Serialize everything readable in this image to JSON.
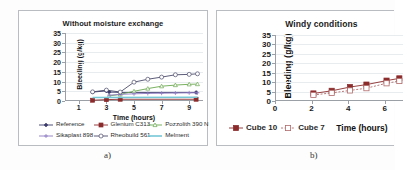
{
  "figure": {
    "caption_a": "a)",
    "caption_b": "b)"
  },
  "chart_data": [
    {
      "panel": "a",
      "type": "line",
      "title": "Without moisture exchange",
      "xlabel": "Time (hours)",
      "ylabel": "Bleeding (g/kg)",
      "xlim": [
        0,
        10
      ],
      "ylim": [
        0,
        35
      ],
      "xticks": [
        1,
        3,
        5,
        7,
        9
      ],
      "yticks": [
        0,
        5,
        10,
        15,
        20,
        25,
        30,
        35
      ],
      "grid": true,
      "legend_position": "bottom",
      "series": [
        {
          "name": "Reference",
          "color": "#3b3b6b",
          "marker": "diamond",
          "x": [
            2,
            3,
            3.2,
            4,
            9.5
          ],
          "values": [
            4.6,
            5.2,
            4.6,
            4.4,
            4.4
          ]
        },
        {
          "name": "Glenium C313",
          "color": "#8c2b2b",
          "marker": "square",
          "x": [
            2,
            3,
            4,
            9.5
          ],
          "values": [
            0.4,
            0.7,
            0.9,
            0.9
          ]
        },
        {
          "name": "Pozzolith 390 N",
          "color": "#6aa84f",
          "marker": "triangle",
          "x": [
            3.2,
            4,
            5,
            6,
            7,
            8,
            9,
            9.6
          ],
          "values": [
            2.6,
            3.4,
            5.0,
            6.4,
            7.6,
            8.2,
            8.6,
            8.7
          ]
        },
        {
          "name": "Sikaplast 898",
          "color": "#8e7cc3",
          "marker": "plus",
          "x": [
            3.2,
            4,
            5,
            6,
            7,
            8,
            9,
            9.6
          ],
          "values": [
            3.0,
            3.4,
            3.7,
            3.9,
            4.0,
            4.1,
            4.2,
            4.2
          ]
        },
        {
          "name": "Rheobuild 561",
          "color": "#4b4b6b",
          "marker": "circle",
          "x": [
            2,
            3,
            4,
            5,
            6,
            7,
            8,
            9,
            9.6
          ],
          "values": [
            4.7,
            5.6,
            4.6,
            9.7,
            11.2,
            12.3,
            13.5,
            13.7,
            14.0
          ]
        },
        {
          "name": "Melment",
          "color": "#76c7d6",
          "marker": "none",
          "x": [
            2,
            9.6
          ],
          "values": [
            1.8,
            1.9
          ]
        }
      ]
    },
    {
      "panel": "b",
      "type": "line",
      "title": "Windy conditions",
      "xlabel": "Time (hours)",
      "ylabel": "Bleeding (g/kg)",
      "xlim": [
        0,
        7
      ],
      "ylim": [
        0,
        35
      ],
      "xticks": [
        0,
        2,
        4,
        6
      ],
      "yticks": [
        0,
        5,
        10,
        15,
        20,
        25,
        30,
        35
      ],
      "grid": true,
      "legend_position": "bottom",
      "series": [
        {
          "name": "Cube 10",
          "color": "#8c2b2b",
          "marker": "square-filled",
          "x": [
            2.1,
            3.1,
            4.1,
            5.0,
            6.1,
            6.8
          ],
          "values": [
            4.0,
            5.4,
            7.4,
            8.7,
            10.8,
            12.0
          ]
        },
        {
          "name": "Cube 7",
          "color": "#b06a6a",
          "marker": "square-open",
          "x": [
            2.1,
            3.1,
            4.1,
            5.0,
            6.1,
            6.8
          ],
          "values": [
            3.2,
            4.3,
            5.6,
            6.8,
            9.4,
            10.6
          ]
        }
      ]
    }
  ]
}
